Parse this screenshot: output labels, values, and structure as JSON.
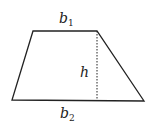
{
  "diagram": {
    "type": "trapezoid",
    "shape": {
      "vertices": [
        [
          33,
          31
        ],
        [
          97,
          31
        ],
        [
          144,
          101
        ],
        [
          12,
          100
        ]
      ],
      "stroke": "#222222"
    },
    "height_line": {
      "x": 97,
      "y1": 31,
      "y2": 101,
      "style": "dashed"
    },
    "labels": {
      "top_base": {
        "var": "b",
        "sub": "1"
      },
      "height": {
        "var": "h"
      },
      "bottom_base": {
        "var": "b",
        "sub": "2"
      }
    }
  }
}
